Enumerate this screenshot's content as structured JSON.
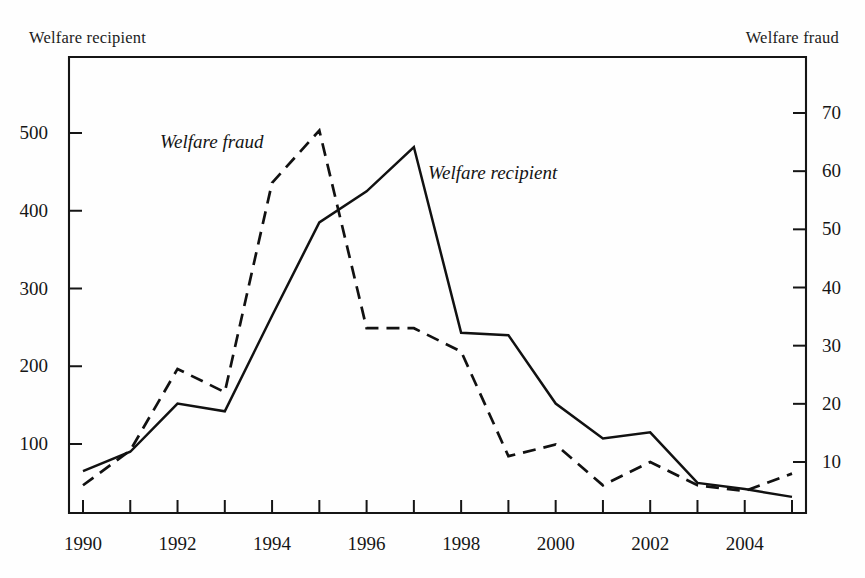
{
  "chart_data": {
    "type": "line",
    "title": "",
    "subtitle": "",
    "xlabel": "",
    "grid": false,
    "legend_position": "inline-annotations",
    "x": [
      1990,
      1991,
      1992,
      1993,
      1994,
      1995,
      1996,
      1997,
      1998,
      1999,
      2000,
      2001,
      2002,
      2003,
      2004,
      2005
    ],
    "categories": [
      "1990",
      "1991",
      "1992",
      "1993",
      "1994",
      "1995",
      "1996",
      "1997",
      "1998",
      "1999",
      "2000",
      "2001",
      "2002",
      "2003",
      "2004",
      "2005"
    ],
    "series": [
      {
        "name": "Welfare recipient",
        "axis": "left",
        "style": "solid",
        "color": "#111111",
        "values": [
          65,
          90,
          152,
          142,
          265,
          385,
          425,
          482,
          243,
          240,
          152,
          107,
          115,
          50,
          42,
          32
        ]
      },
      {
        "name": "Welfare fraud",
        "axis": "right",
        "style": "dashed",
        "color": "#111111",
        "values": [
          6,
          12,
          26,
          22,
          58,
          67,
          33,
          33,
          29,
          11,
          13,
          6,
          10,
          6,
          5,
          8
        ]
      }
    ],
    "left_axis": {
      "label": "Welfare recipient",
      "ticks": [
        100,
        200,
        300,
        400,
        500
      ],
      "tick_labels": [
        "100",
        "200",
        "300",
        "400",
        "500"
      ],
      "ylim": [
        0,
        592
      ]
    },
    "right_axis": {
      "label": "Welfare fraud",
      "ticks": [
        10,
        20,
        30,
        40,
        50,
        60,
        70
      ],
      "tick_labels": [
        "10",
        "20",
        "30",
        "40",
        "50",
        "60",
        "70"
      ],
      "ylim": [
        0,
        78.6
      ]
    },
    "x_axis": {
      "tick_labels_shown": [
        "1990",
        "1992",
        "1994",
        "1996",
        "1998",
        "2000",
        "2002",
        "2004"
      ],
      "xlim": [
        1990,
        2005
      ]
    },
    "annotations": [
      {
        "text": "Welfare fraud",
        "series": "Welfare fraud"
      },
      {
        "text": "Welfare recipient",
        "series": "Welfare recipient"
      }
    ]
  },
  "captions": {
    "left": "Welfare recipient",
    "right": "Welfare fraud"
  }
}
